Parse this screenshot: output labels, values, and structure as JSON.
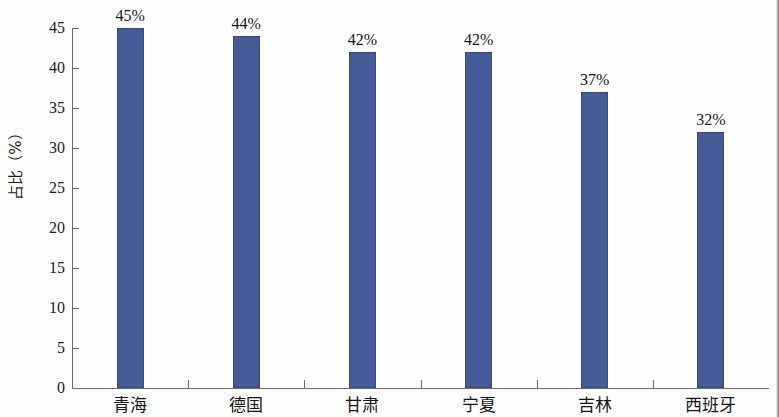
{
  "chart_data": {
    "type": "bar",
    "title": "",
    "subtitle": "",
    "xlabel": "",
    "ylabel": "占比（%）",
    "categories": [
      "青海",
      "德国",
      "甘肃",
      "宁夏",
      "吉林",
      "西班牙"
    ],
    "values": [
      45,
      44,
      42,
      42,
      37,
      32
    ],
    "data_labels": [
      "45%",
      "44%",
      "42%",
      "42%",
      "37%",
      "32%"
    ],
    "series": [
      {
        "name": "占比",
        "values": [
          45,
          44,
          42,
          42,
          37,
          32
        ],
        "color": "#465a96"
      }
    ],
    "ylim": [
      0,
      45
    ],
    "ytick_values": [
      0,
      5,
      10,
      15,
      20,
      25,
      30,
      35,
      40,
      45
    ],
    "ytick_labels": [
      "0",
      "5",
      "10",
      "15",
      "20",
      "25",
      "30",
      "35",
      "40",
      "45"
    ],
    "grid": false,
    "legend": false,
    "legend_position": "none",
    "orientation": "vertical",
    "bar_color": "#465a96",
    "axis_color": "#6b6b6b",
    "background_color": "#ffffff"
  }
}
